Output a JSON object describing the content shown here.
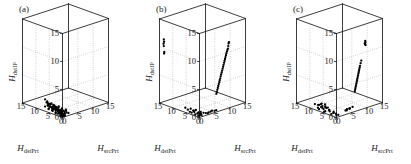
{
  "figure": {
    "panel_count": 3,
    "background_color": "#ffffff",
    "ink_color": "#1a1a1a",
    "grid_color": "#9a9a9a",
    "marker_color": "#000000"
  },
  "axes": {
    "x_label_main": "H",
    "x_label_sub": "srcPrt",
    "y_label_main": "H",
    "y_label_sub": "dstPrt",
    "z_label_main": "H",
    "z_label_sub": "dstIP",
    "x_ticks": [
      "0",
      "5",
      "10",
      "15"
    ],
    "y_ticks": [
      "0",
      "5",
      "10",
      "15"
    ],
    "z_ticks": [
      "0",
      "5",
      "10",
      "15"
    ],
    "x_range": [
      0,
      15
    ],
    "y_range": [
      0,
      15
    ],
    "z_range": [
      0,
      15
    ],
    "grid": "dotted"
  },
  "chart_data": {
    "type": "scatter",
    "title": "",
    "subtitle": "",
    "xlabel": "H_srcPrt",
    "ylabel": "H_dstPrt",
    "zlabel": "H_dstIP",
    "xlim": [
      0,
      15
    ],
    "ylim": [
      0,
      15
    ],
    "zlim": [
      0,
      15
    ],
    "grid": true,
    "legend": "none",
    "projection": "3d",
    "panels": [
      {
        "label": "(a)",
        "description": "Single dense low-entropy cluster concentrated near the origin on the floor plane",
        "points": [
          [
            0.5,
            0.4,
            0.2
          ],
          [
            0.6,
            0.7,
            0.1
          ],
          [
            0.8,
            0.5,
            0.3
          ],
          [
            0.4,
            0.9,
            0.2
          ],
          [
            0.9,
            1.1,
            0.4
          ],
          [
            1.1,
            0.6,
            0.2
          ],
          [
            0.7,
            1.4,
            0.5
          ],
          [
            1.3,
            0.8,
            0.3
          ],
          [
            0.5,
            1.8,
            0.6
          ],
          [
            1.0,
            1.2,
            0.2
          ],
          [
            0.6,
            2.2,
            0.8
          ],
          [
            1.2,
            1.6,
            0.4
          ],
          [
            0.8,
            2.6,
            0.9
          ],
          [
            0.4,
            3.0,
            0.3
          ],
          [
            1.4,
            2.0,
            0.6
          ],
          [
            0.9,
            3.4,
            1.1
          ],
          [
            0.5,
            3.8,
            0.7
          ],
          [
            1.1,
            2.8,
            0.5
          ],
          [
            0.7,
            4.2,
            1.3
          ],
          [
            1.5,
            3.2,
            0.9
          ],
          [
            0.6,
            4.6,
            0.4
          ],
          [
            1.0,
            4.0,
            1.0
          ],
          [
            0.8,
            5.1,
            1.5
          ],
          [
            0.4,
            5.5,
            0.6
          ],
          [
            1.2,
            4.8,
            1.2
          ],
          [
            0.9,
            5.9,
            0.8
          ],
          [
            0.5,
            6.3,
            1.7
          ],
          [
            1.3,
            5.3,
            0.5
          ],
          [
            0.7,
            6.8,
            1.4
          ],
          [
            1.6,
            1.0,
            0.3
          ],
          [
            0.3,
            0.3,
            0.1
          ],
          [
            1.8,
            1.4,
            0.5
          ],
          [
            0.2,
            1.1,
            0.2
          ],
          [
            2.0,
            0.8,
            0.4
          ],
          [
            1.7,
            2.4,
            0.7
          ],
          [
            0.3,
            2.0,
            0.3
          ],
          [
            1.9,
            3.6,
            1.0
          ],
          [
            0.6,
            7.2,
            1.9
          ],
          [
            1.4,
            6.0,
            1.1
          ],
          [
            2.2,
            1.2,
            0.6
          ],
          [
            0.4,
            0.6,
            0.15
          ],
          [
            1.05,
            0.95,
            0.25
          ],
          [
            0.75,
            1.75,
            0.45
          ],
          [
            1.25,
            2.45,
            0.65
          ],
          [
            0.55,
            3.15,
            0.55
          ],
          [
            1.45,
            3.85,
            0.85
          ],
          [
            0.85,
            4.55,
            0.95
          ],
          [
            1.15,
            5.25,
            0.75
          ],
          [
            0.65,
            5.95,
            1.25
          ],
          [
            1.35,
            6.55,
            1.05
          ],
          [
            0.45,
            7.05,
            0.65
          ],
          [
            1.55,
            4.35,
            0.45
          ],
          [
            0.95,
            2.15,
            0.35
          ],
          [
            0.25,
            1.45,
            0.55
          ],
          [
            2.1,
            2.6,
            0.8
          ],
          [
            1.75,
            5.0,
            0.95
          ],
          [
            0.35,
            4.1,
            0.4
          ],
          [
            1.95,
            1.85,
            0.55
          ],
          [
            0.15,
            0.8,
            0.1
          ],
          [
            2.35,
            0.5,
            0.3
          ],
          [
            0.7,
            0.2,
            0.05
          ],
          [
            1.1,
            0.35,
            0.12
          ],
          [
            0.5,
            1.05,
            0.22
          ],
          [
            0.9,
            1.55,
            0.32
          ],
          [
            1.3,
            1.95,
            0.42
          ],
          [
            0.6,
            2.35,
            0.52
          ],
          [
            1.0,
            2.75,
            0.62
          ],
          [
            0.8,
            3.25,
            0.72
          ],
          [
            1.2,
            3.65,
            0.52
          ],
          [
            0.4,
            4.25,
            0.82
          ],
          [
            1.4,
            4.65,
            0.62
          ],
          [
            0.7,
            5.45,
            0.92
          ],
          [
            1.1,
            5.75,
            0.72
          ],
          [
            0.5,
            6.15,
            1.02
          ],
          [
            0.9,
            6.45,
            0.82
          ],
          [
            1.25,
            6.95,
            1.12
          ],
          [
            2.5,
            1.6,
            0.7
          ],
          [
            0.3,
            5.6,
            0.5
          ],
          [
            1.85,
            4.4,
            0.75
          ],
          [
            0.2,
            2.8,
            0.25
          ]
        ]
      },
      {
        "label": "(b)",
        "description": "Floor cluster near origin plus an elongated diagonal streak rising on the right wall and isolated marks on the left wall",
        "points": [
          [
            0.5,
            0.5,
            0.2
          ],
          [
            0.8,
            0.9,
            0.3
          ],
          [
            1.2,
            0.6,
            0.1
          ],
          [
            0.6,
            1.4,
            0.4
          ],
          [
            1.0,
            1.9,
            0.2
          ],
          [
            0.4,
            2.4,
            0.5
          ],
          [
            1.4,
            2.0,
            0.3
          ],
          [
            0.7,
            3.0,
            0.6
          ],
          [
            1.1,
            3.6,
            0.4
          ],
          [
            0.5,
            4.2,
            0.2
          ],
          [
            1.3,
            4.8,
            0.5
          ],
          [
            0.9,
            5.4,
            0.3
          ],
          [
            0.6,
            6.0,
            0.6
          ],
          [
            1.5,
            1.2,
            0.2
          ],
          [
            0.3,
            0.8,
            0.1
          ],
          [
            1.8,
            1.6,
            0.4
          ],
          [
            0.2,
            1.8,
            0.2
          ],
          [
            2.1,
            0.9,
            0.3
          ],
          [
            1.6,
            3.2,
            0.5
          ],
          [
            0.4,
            3.4,
            0.2
          ],
          [
            2.4,
            0.4,
            0.3
          ],
          [
            3.4,
            0.5,
            0.2
          ],
          [
            4.6,
            0.6,
            0.3
          ],
          [
            5.8,
            0.4,
            0.2
          ],
          [
            2.9,
            0.3,
            0.15
          ],
          [
            4.0,
            0.45,
            0.25
          ],
          [
            5.2,
            0.35,
            0.2
          ],
          [
            6.2,
            0.8,
            3.0
          ],
          [
            6.6,
            0.9,
            3.6
          ],
          [
            7.0,
            1.0,
            4.2
          ],
          [
            7.4,
            1.1,
            4.8
          ],
          [
            7.8,
            1.2,
            5.4
          ],
          [
            8.2,
            1.3,
            6.0
          ],
          [
            8.6,
            1.4,
            6.6
          ],
          [
            9.0,
            1.5,
            7.2
          ],
          [
            9.4,
            1.6,
            7.8
          ],
          [
            9.8,
            1.7,
            8.4
          ],
          [
            10.2,
            1.8,
            9.0
          ],
          [
            10.6,
            1.9,
            9.6
          ],
          [
            11.0,
            2.0,
            10.0
          ],
          [
            11.2,
            2.1,
            10.4
          ],
          [
            11.4,
            2.2,
            10.8
          ],
          [
            11.6,
            2.3,
            11.0
          ],
          [
            6.4,
            0.85,
            3.3
          ],
          [
            6.8,
            0.95,
            3.9
          ],
          [
            7.2,
            1.05,
            4.5
          ],
          [
            7.6,
            1.15,
            5.1
          ],
          [
            8.0,
            1.25,
            5.7
          ],
          [
            8.4,
            1.35,
            6.3
          ],
          [
            8.8,
            1.45,
            6.9
          ],
          [
            9.2,
            1.55,
            7.5
          ],
          [
            9.6,
            1.65,
            8.1
          ],
          [
            10.0,
            1.75,
            8.7
          ],
          [
            10.4,
            1.85,
            9.3
          ],
          [
            10.8,
            1.95,
            9.8
          ],
          [
            0.1,
            13.5,
            11.6
          ],
          [
            0.1,
            13.4,
            11.2
          ],
          [
            0.1,
            13.6,
            10.8
          ],
          [
            0.1,
            13.5,
            10.4
          ],
          [
            0.1,
            13.3,
            9.4
          ],
          [
            0.1,
            13.4,
            9.1
          ]
        ]
      },
      {
        "label": "(c)",
        "description": "Broad floor cluster spread along the dstPrt axis plus a diagonal streak rising at mid-right and a compact blob higher up",
        "points": [
          [
            0.5,
            0.6,
            0.2
          ],
          [
            0.9,
            1.2,
            0.3
          ],
          [
            1.3,
            0.8,
            0.1
          ],
          [
            0.6,
            1.8,
            0.4
          ],
          [
            1.1,
            2.4,
            0.2
          ],
          [
            0.4,
            3.0,
            0.5
          ],
          [
            1.5,
            2.8,
            0.3
          ],
          [
            0.8,
            3.6,
            0.6
          ],
          [
            1.2,
            4.2,
            0.4
          ],
          [
            0.5,
            4.8,
            0.2
          ],
          [
            1.4,
            5.4,
            0.5
          ],
          [
            1.0,
            6.0,
            0.3
          ],
          [
            0.7,
            6.6,
            0.6
          ],
          [
            1.6,
            7.2,
            0.2
          ],
          [
            0.3,
            5.0,
            0.1
          ],
          [
            1.9,
            6.4,
            0.4
          ],
          [
            0.2,
            2.2,
            0.2
          ],
          [
            2.2,
            7.8,
            0.3
          ],
          [
            1.7,
            8.4,
            0.5
          ],
          [
            0.4,
            7.0,
            0.2
          ],
          [
            2.6,
            8.8,
            0.4
          ],
          [
            2.0,
            9.2,
            0.3
          ],
          [
            1.3,
            9.6,
            0.5
          ],
          [
            0.9,
            8.0,
            0.2
          ],
          [
            2.4,
            6.0,
            0.3
          ],
          [
            3.0,
            9.0,
            0.4
          ],
          [
            2.8,
            7.4,
            0.2
          ],
          [
            3.4,
            8.2,
            0.3
          ],
          [
            3.8,
            1.0,
            0.4
          ],
          [
            4.4,
            1.2,
            0.3
          ],
          [
            5.0,
            0.9,
            0.5
          ],
          [
            5.6,
            1.4,
            0.4
          ],
          [
            6.2,
            1.1,
            0.6
          ],
          [
            4.8,
            1.6,
            0.35
          ],
          [
            5.3,
            1.25,
            0.45
          ],
          [
            7.0,
            1.2,
            3.2
          ],
          [
            7.3,
            1.3,
            3.7
          ],
          [
            7.6,
            1.4,
            4.2
          ],
          [
            7.9,
            1.5,
            4.7
          ],
          [
            8.2,
            1.6,
            5.2
          ],
          [
            8.5,
            1.7,
            5.7
          ],
          [
            8.8,
            1.8,
            6.2
          ],
          [
            9.1,
            1.9,
            6.7
          ],
          [
            9.4,
            2.0,
            7.2
          ],
          [
            9.7,
            2.1,
            7.6
          ],
          [
            10.0,
            2.2,
            8.0
          ],
          [
            7.15,
            1.25,
            3.45
          ],
          [
            7.45,
            1.35,
            3.95
          ],
          [
            7.75,
            1.45,
            4.45
          ],
          [
            8.05,
            1.55,
            4.95
          ],
          [
            8.35,
            1.65,
            5.45
          ],
          [
            8.65,
            1.75,
            5.95
          ],
          [
            8.95,
            1.85,
            6.45
          ],
          [
            9.25,
            1.95,
            6.95
          ],
          [
            11.4,
            2.4,
            10.6
          ],
          [
            11.6,
            2.5,
            10.9
          ],
          [
            11.5,
            2.45,
            11.2
          ],
          [
            11.7,
            2.55,
            10.4
          ],
          [
            11.45,
            2.6,
            10.75
          ]
        ]
      }
    ]
  }
}
